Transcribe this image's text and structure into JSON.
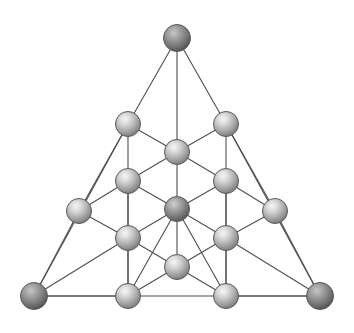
{
  "figure": {
    "background_color": "#ffffff",
    "width": 354,
    "height": 333,
    "bond_color": "#4f4f4f",
    "bond_width": 1.1,
    "sphere_outline_color": "#5a5a5a",
    "sphere_outline_width": 1.0,
    "palette": {
      "light_sphere_highlight": "#f2f2f2",
      "light_sphere_mid": "#b4b4b4",
      "light_sphere_edge": "#7d7d7d",
      "dark_sphere_highlight": "#c9c9c9",
      "dark_sphere_mid": "#8c8c8c",
      "dark_sphere_edge": "#595959",
      "corner_sphere_highlight": "#bdbdbd",
      "corner_sphere_mid": "#838383",
      "corner_sphere_edge": "#545454"
    }
  },
  "chart_data": {
    "type": "scatter",
    "subtitle": "",
    "xlabel": "",
    "ylabel": "",
    "xlim": [
      0,
      354
    ],
    "ylim": [
      0,
      333
    ],
    "grid": false,
    "legend": null,
    "node_count": 20,
    "edge_count": 42,
    "nodes": [
      {
        "id": "apex",
        "label": "apex-vertex",
        "x": 177,
        "y": 38,
        "r": 13.5,
        "shade": "corner"
      },
      {
        "id": "l2a",
        "label": "row2-left",
        "x": 128,
        "y": 124,
        "r": 12.5,
        "shade": "light"
      },
      {
        "id": "l2b",
        "label": "row2-right",
        "x": 226,
        "y": 124,
        "r": 12.5,
        "shade": "light"
      },
      {
        "id": "l2c",
        "label": "row2-center-front",
        "x": 177,
        "y": 152,
        "r": 12.5,
        "shade": "light"
      },
      {
        "id": "l3a",
        "label": "row3-left-outer",
        "x": 79,
        "y": 211,
        "r": 12.5,
        "shade": "light"
      },
      {
        "id": "l3b",
        "label": "row3-left-inner",
        "x": 128,
        "y": 181,
        "r": 12.5,
        "shade": "light"
      },
      {
        "id": "l3c",
        "label": "row3-right-inner",
        "x": 226,
        "y": 181,
        "r": 12.5,
        "shade": "light"
      },
      {
        "id": "l3d",
        "label": "row3-right-outer",
        "x": 275,
        "y": 211,
        "r": 12.5,
        "shade": "light"
      },
      {
        "id": "l3e",
        "label": "row3-center",
        "x": 177,
        "y": 209,
        "r": 12.5,
        "shade": "dark"
      },
      {
        "id": "l3f",
        "label": "row3-mid-left",
        "x": 128,
        "y": 238,
        "r": 12.5,
        "shade": "light"
      },
      {
        "id": "l3g",
        "label": "row3-mid-right",
        "x": 226,
        "y": 238,
        "r": 12.5,
        "shade": "light"
      },
      {
        "id": "l4a",
        "label": "base-left-corner",
        "x": 34,
        "y": 296,
        "r": 13.5,
        "shade": "corner"
      },
      {
        "id": "l4b",
        "label": "base-left-mid",
        "x": 128,
        "y": 296,
        "r": 12.5,
        "shade": "light"
      },
      {
        "id": "l4c",
        "label": "base-center-front",
        "x": 177,
        "y": 267,
        "r": 12.5,
        "shade": "light"
      },
      {
        "id": "l4d",
        "label": "base-right-mid",
        "x": 226,
        "y": 296,
        "r": 12.5,
        "shade": "light"
      },
      {
        "id": "l4e",
        "label": "base-right-corner",
        "x": 320,
        "y": 296,
        "r": 13.5,
        "shade": "corner"
      }
    ],
    "edges": [
      [
        "apex",
        "l2a"
      ],
      [
        "apex",
        "l2b"
      ],
      [
        "apex",
        "l2c"
      ],
      [
        "l2a",
        "l2c"
      ],
      [
        "l2b",
        "l2c"
      ],
      [
        "l2a",
        "l3b"
      ],
      [
        "l2b",
        "l3c"
      ],
      [
        "l2c",
        "l3e"
      ],
      [
        "l2a",
        "l3a"
      ],
      [
        "l2b",
        "l3d"
      ],
      [
        "l2c",
        "l3b"
      ],
      [
        "l2c",
        "l3c"
      ],
      [
        "l3a",
        "l3b"
      ],
      [
        "l3c",
        "l3d"
      ],
      [
        "l3b",
        "l3e"
      ],
      [
        "l3c",
        "l3e"
      ],
      [
        "l3b",
        "l3f"
      ],
      [
        "l3c",
        "l3g"
      ],
      [
        "l3e",
        "l3f"
      ],
      [
        "l3e",
        "l3g"
      ],
      [
        "l3a",
        "l3f"
      ],
      [
        "l3d",
        "l3g"
      ],
      [
        "l3e",
        "l4c"
      ],
      [
        "l3f",
        "l4c"
      ],
      [
        "l3g",
        "l4c"
      ],
      [
        "l3f",
        "l4b"
      ],
      [
        "l3g",
        "l4d"
      ],
      [
        "l3a",
        "l4a"
      ],
      [
        "l3d",
        "l4e"
      ],
      [
        "l4a",
        "l4b"
      ],
      [
        "l4b",
        "l4c"
      ],
      [
        "l4c",
        "l4d"
      ],
      [
        "l4d",
        "l4e"
      ],
      [
        "l4a",
        "l4e"
      ],
      [
        "l2a",
        "l4a"
      ],
      [
        "l2b",
        "l4e"
      ],
      [
        "l3f",
        "l4a"
      ],
      [
        "l3g",
        "l4e"
      ],
      [
        "l3b",
        "l4b"
      ],
      [
        "l3c",
        "l4d"
      ],
      [
        "l3e",
        "l4b"
      ],
      [
        "l3e",
        "l4d"
      ]
    ]
  }
}
